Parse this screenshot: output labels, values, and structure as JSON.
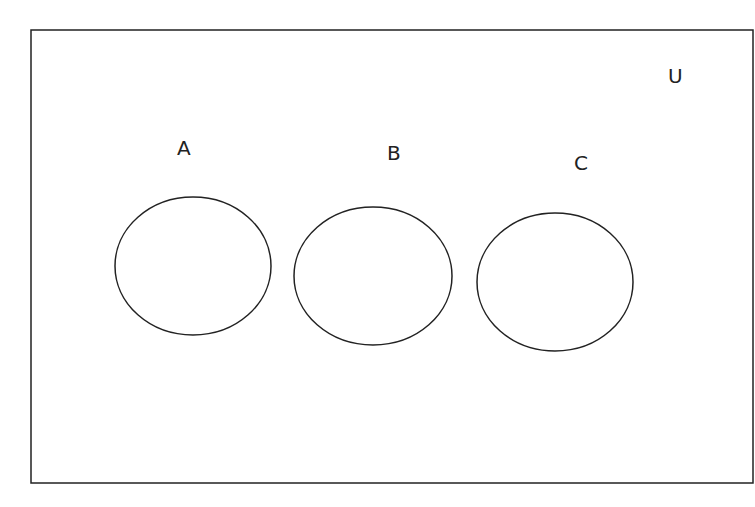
{
  "diagram": {
    "type": "venn",
    "universe_label": "U",
    "sets": [
      {
        "label": "A"
      },
      {
        "label": "B"
      },
      {
        "label": "C"
      }
    ],
    "relationship": "disjoint",
    "colors": {
      "stroke": "#222222",
      "background": "#ffffff"
    }
  }
}
